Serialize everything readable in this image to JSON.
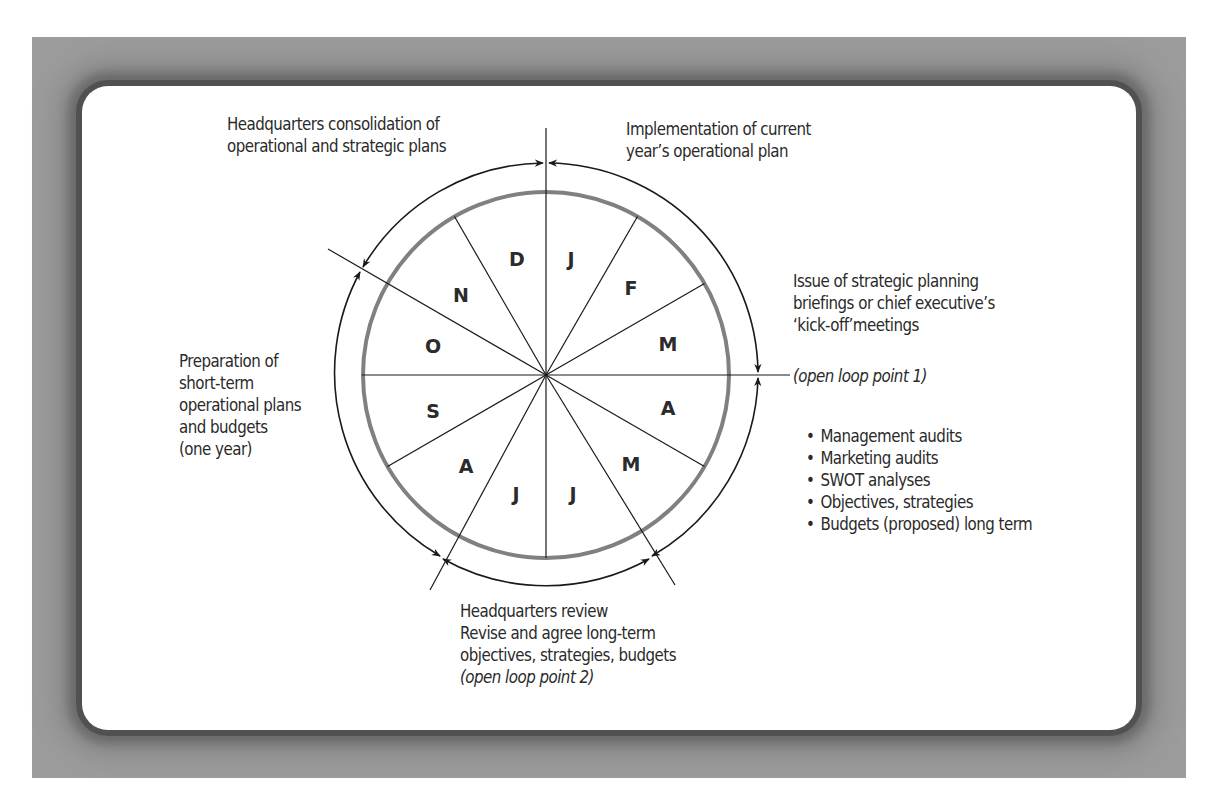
{
  "diagram": {
    "type": "planning-cycle-wheel",
    "months": [
      {
        "label": "J",
        "angle": 75
      },
      {
        "label": "F",
        "angle": 45
      },
      {
        "label": "M",
        "angle": 15
      },
      {
        "label": "A",
        "angle": -15
      },
      {
        "label": "M",
        "angle": -45
      },
      {
        "label": "J",
        "angle": -75
      },
      {
        "label": "J",
        "angle": -105
      },
      {
        "label": "A",
        "angle": -135
      },
      {
        "label": "S",
        "angle": -165
      },
      {
        "label": "O",
        "angle": 165
      },
      {
        "label": "N",
        "angle": 135
      },
      {
        "label": "D",
        "angle": 105
      }
    ],
    "colors": {
      "frame": "#9c9c9c",
      "card": "#ffffff",
      "inner_ring": "#808080",
      "lines": "#1a1a1a",
      "text": "#2a2a2a"
    }
  },
  "labels": {
    "hq_consolidation": [
      "Headquarters consolidation of",
      "operational and strategic plans"
    ],
    "implementation": [
      "Implementation of current",
      "year’s operational plan"
    ],
    "issue_briefings": [
      "Issue of strategic planning",
      "briefings or chief executive’s",
      "‘kick-off’meetings"
    ],
    "open_loop_1": "(open loop point 1)",
    "preparation": [
      "Preparation of",
      "short-term",
      "operational plans",
      "and budgets",
      "(one year)"
    ],
    "bullets": [
      "Management audits",
      "Marketing audits",
      "SWOT analyses",
      "Objectives, strategies",
      "Budgets (proposed) long term"
    ],
    "hq_review": [
      "Headquarters review",
      "Revise and agree long-term",
      "objectives, strategies, budgets"
    ],
    "open_loop_2": "(open loop point 2)"
  }
}
